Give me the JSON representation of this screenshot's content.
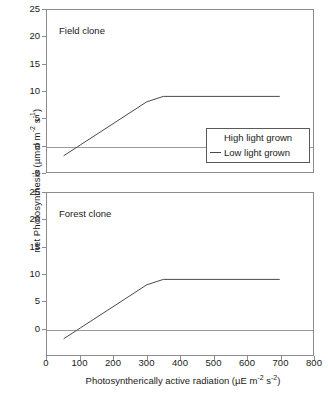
{
  "chart_data": {
    "type": "line",
    "title": "",
    "xlabel": "Photosyntherically active radiation (µE m-2 s-2)",
    "ylabel": "net Photosynthesis (µmol m-2 s-1)",
    "xlabel_parts": {
      "pre": "Photosyntherically active radiation (µE m",
      "sup1": "-2",
      "mid": " s",
      "sup2": "-2",
      "post": ")"
    },
    "ylabel_parts": {
      "pre": "net Photosynthesis (µmol m",
      "sup1": "-2",
      "mid": " s",
      "sup2": "-1",
      "post": ")"
    },
    "xlim": [
      0,
      800
    ],
    "xticks": [
      0,
      100,
      200,
      300,
      400,
      500,
      600,
      700,
      800
    ],
    "xticklabels": [
      "0",
      "100",
      "200",
      "300",
      "400",
      "500",
      "600",
      "700",
      "800"
    ],
    "grid": false,
    "legend": {
      "position": "inside-top-panel-right",
      "entries": [
        {
          "label": "High light grown",
          "marker": "none",
          "color": "#ffffff"
        },
        {
          "label": "Low light grown",
          "marker": "line",
          "color": "#4a4a4a"
        }
      ]
    },
    "panels": [
      {
        "id": "top",
        "caption": "Field clone",
        "ylim": [
          -5,
          25
        ],
        "yticks": [
          25,
          20,
          15,
          10,
          5,
          0,
          -5
        ],
        "yticklabels": [
          "25",
          "20",
          "15",
          "10",
          "5",
          "0",
          "-5"
        ],
        "zero_line": 0,
        "series": [
          {
            "name": "Low light grown",
            "color": "#4a4a4a",
            "x": [
              50,
              100,
              300,
              350,
              700
            ],
            "y": [
              -2.0,
              0.0,
              8.0,
              9.0,
              9.0
            ]
          }
        ]
      },
      {
        "id": "bottom",
        "caption": "Forest clone",
        "ylim": [
          -5,
          25
        ],
        "yticks": [
          25,
          20,
          15,
          10,
          5,
          0
        ],
        "yticklabels": [
          "25",
          "20",
          "15",
          "10",
          "5",
          "0"
        ],
        "zero_line": 0,
        "series": [
          {
            "name": "Low light grown",
            "color": "#4a4a4a",
            "x": [
              50,
              100,
              300,
              350,
              700
            ],
            "y": [
              -2.0,
              0.0,
              8.0,
              9.0,
              9.0
            ]
          }
        ]
      }
    ]
  }
}
